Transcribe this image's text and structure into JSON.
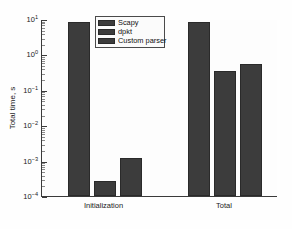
{
  "chart_data": {
    "type": "bar",
    "title": "",
    "xlabel": "",
    "ylabel": "Total time, s",
    "categories": [
      "Initialization",
      "Total"
    ],
    "series": [
      {
        "name": "Scapy",
        "values": [
          8.0,
          8.0
        ],
        "color": "#3c3c3c"
      },
      {
        "name": "dpkt",
        "values": [
          0.00026,
          0.33
        ],
        "color": "#3c3c3c"
      },
      {
        "name": "Custom parser",
        "values": [
          0.0012,
          0.55
        ],
        "color": "#3c3c3c"
      }
    ],
    "yscale": "log",
    "ylim": [
      0.0001,
      10
    ],
    "ytick_labels": [
      "10¹",
      "10⁰",
      "10⁻¹",
      "10⁻²",
      "10⁻³",
      "10⁻⁴"
    ],
    "ytick_values": [
      10,
      1,
      0.1,
      0.01,
      0.001,
      0.0001
    ],
    "grid": false,
    "legend_position": "top-center"
  },
  "axis": {
    "y_title": "Total time, s",
    "ticks": [
      {
        "mantissa": "10",
        "exponent": "1"
      },
      {
        "mantissa": "10",
        "exponent": "0"
      },
      {
        "mantissa": "10",
        "exponent": "-1"
      },
      {
        "mantissa": "10",
        "exponent": "-2"
      },
      {
        "mantissa": "10",
        "exponent": "-3"
      },
      {
        "mantissa": "10",
        "exponent": "-4"
      }
    ],
    "x_labels": [
      "Initialization",
      "Total"
    ]
  },
  "legend": {
    "items": [
      {
        "label": "Scapy"
      },
      {
        "label": "dpkt"
      },
      {
        "label": "Custom parser"
      }
    ]
  }
}
